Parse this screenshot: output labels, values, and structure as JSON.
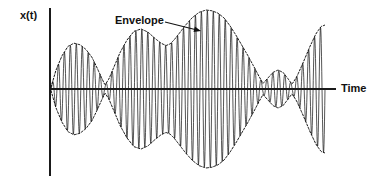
{
  "figure": {
    "background_color": "#ffffff",
    "line_color": "#1c1c1c",
    "envelope_color": "#111111",
    "axis_color": "#1a1a1a"
  },
  "labels": {
    "y_axis": "x(t)",
    "x_axis": "Time",
    "annotation": "Envelope"
  },
  "chart_data": {
    "type": "line",
    "title": "",
    "xlabel": "Time",
    "ylabel": "x(t)",
    "grid": false,
    "legend": null,
    "annotations": [
      {
        "text": "Envelope",
        "text_x": 115,
        "text_y": 15,
        "arrow_from_x": 165,
        "arrow_from_y": 22,
        "arrow_to_x": 201,
        "arrow_to_y": 31,
        "points_to": "upper dashed envelope curve"
      }
    ],
    "axes": {
      "origin_x": 50,
      "baseline_y": 89,
      "y_axis_top": 8,
      "y_axis_bottom": 176,
      "x_axis_left": 50,
      "x_axis_right": 336,
      "signal_start_x": 51,
      "signal_end_x": 325
    },
    "carrier": {
      "cycles": 46,
      "relative_frequency": "high"
    },
    "envelope": {
      "description": "Upper envelope sampled as fraction of maximum amplitude versus horizontal pixel position; lower envelope is its mirror about the baseline.",
      "x": [
        51,
        56,
        62,
        68,
        74,
        80,
        86,
        92,
        97,
        102,
        105,
        109,
        114,
        120,
        127,
        134,
        141,
        148,
        155,
        161,
        166,
        170,
        174,
        179,
        185,
        192,
        199,
        206,
        212,
        218,
        224,
        230,
        236,
        242,
        248,
        254,
        259,
        263,
        268,
        273,
        278,
        283,
        288,
        292,
        297,
        303,
        310,
        316,
        321,
        325
      ],
      "y_fraction": [
        0.02,
        0.24,
        0.42,
        0.54,
        0.58,
        0.56,
        0.5,
        0.4,
        0.27,
        0.13,
        0.05,
        0.13,
        0.28,
        0.46,
        0.62,
        0.73,
        0.76,
        0.72,
        0.64,
        0.58,
        0.55,
        0.57,
        0.62,
        0.7,
        0.8,
        0.9,
        0.97,
        1.0,
        0.99,
        0.96,
        0.9,
        0.8,
        0.68,
        0.55,
        0.42,
        0.28,
        0.16,
        0.07,
        0.14,
        0.21,
        0.24,
        0.21,
        0.13,
        0.06,
        0.16,
        0.33,
        0.54,
        0.7,
        0.79,
        0.81
      ],
      "max_amplitude_pixels": 79,
      "nodes_x": [
        105,
        263,
        292
      ],
      "antinodes_x": [
        74,
        141,
        206,
        278,
        325
      ]
    },
    "xlim": [
      50,
      336
    ],
    "ylim": [
      -1,
      1
    ]
  }
}
